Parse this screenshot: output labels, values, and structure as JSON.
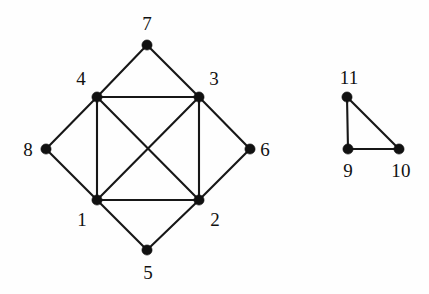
{
  "figure": {
    "kind": "undirected-graph-diagram",
    "background_color": "#fefefe",
    "ink_color": "#111111",
    "width": 429,
    "height": 294
  },
  "chart_data": {
    "type": "diagram",
    "title": "",
    "subtitle": "",
    "xlabel": "",
    "ylabel": "",
    "grid": false,
    "legend": false,
    "graph_type": "undirected simple graph",
    "component_count": 2,
    "vertex_count": 11,
    "edge_count": 17,
    "vertices": [
      {
        "id": "1",
        "label": "1",
        "x": 97,
        "y": 200,
        "label_x": 82,
        "label_y": 219,
        "degree": 5,
        "component": 1
      },
      {
        "id": "2",
        "label": "2",
        "x": 199,
        "y": 200,
        "label_x": 215,
        "label_y": 219,
        "degree": 5,
        "component": 1
      },
      {
        "id": "3",
        "label": "3",
        "x": 199,
        "y": 97,
        "label_x": 214,
        "label_y": 78,
        "degree": 5,
        "component": 1
      },
      {
        "id": "4",
        "label": "4",
        "x": 97,
        "y": 97,
        "label_x": 81,
        "label_y": 78,
        "degree": 5,
        "component": 1
      },
      {
        "id": "5",
        "label": "5",
        "x": 147,
        "y": 250,
        "label_x": 148,
        "label_y": 272,
        "degree": 2,
        "component": 1
      },
      {
        "id": "6",
        "label": "6",
        "x": 250,
        "y": 149,
        "label_x": 265,
        "label_y": 149,
        "degree": 2,
        "component": 1
      },
      {
        "id": "7",
        "label": "7",
        "x": 147,
        "y": 45,
        "label_x": 147,
        "label_y": 23,
        "degree": 2,
        "component": 1
      },
      {
        "id": "8",
        "label": "8",
        "x": 46,
        "y": 149,
        "label_x": 28,
        "label_y": 149,
        "degree": 2,
        "component": 1
      },
      {
        "id": "9",
        "label": "9",
        "x": 348,
        "y": 149,
        "label_x": 348,
        "label_y": 170,
        "degree": 2,
        "component": 2
      },
      {
        "id": "10",
        "label": "10",
        "x": 399,
        "y": 149,
        "label_x": 401,
        "label_y": 170,
        "degree": 2,
        "component": 2
      },
      {
        "id": "11",
        "label": "11",
        "x": 347,
        "y": 97,
        "label_x": 349,
        "label_y": 77,
        "degree": 2,
        "component": 2
      }
    ],
    "edges": [
      {
        "from": "4",
        "to": "3",
        "name": "edge-4-3"
      },
      {
        "from": "3",
        "to": "2",
        "name": "edge-3-2"
      },
      {
        "from": "2",
        "to": "1",
        "name": "edge-2-1"
      },
      {
        "from": "1",
        "to": "4",
        "name": "edge-1-4"
      },
      {
        "from": "4",
        "to": "2",
        "name": "edge-4-2"
      },
      {
        "from": "3",
        "to": "1",
        "name": "edge-3-1"
      },
      {
        "from": "4",
        "to": "7",
        "name": "edge-4-7"
      },
      {
        "from": "7",
        "to": "3",
        "name": "edge-7-3"
      },
      {
        "from": "3",
        "to": "6",
        "name": "edge-3-6"
      },
      {
        "from": "6",
        "to": "2",
        "name": "edge-6-2"
      },
      {
        "from": "2",
        "to": "5",
        "name": "edge-2-5"
      },
      {
        "from": "5",
        "to": "1",
        "name": "edge-5-1"
      },
      {
        "from": "1",
        "to": "8",
        "name": "edge-1-8"
      },
      {
        "from": "8",
        "to": "4",
        "name": "edge-8-4"
      },
      {
        "from": "11",
        "to": "9",
        "name": "edge-11-9"
      },
      {
        "from": "9",
        "to": "10",
        "name": "edge-9-10"
      },
      {
        "from": "11",
        "to": "10",
        "name": "edge-11-10"
      }
    ],
    "annotations": []
  }
}
